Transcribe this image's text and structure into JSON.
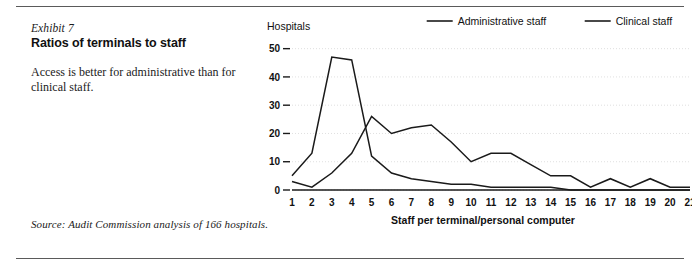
{
  "exhibit": {
    "label": "Exhibit 7",
    "title": "Ratios of terminals to staff",
    "description": "Access is better for administrative than for clinical staff.",
    "source": "Source: Audit Commission analysis of 166 hospitals."
  },
  "chart_data": {
    "type": "line",
    "title": "",
    "xlabel": "Staff per terminal/personal computer",
    "ylabel": "Hospitals",
    "x": [
      1,
      2,
      3,
      4,
      5,
      6,
      7,
      8,
      9,
      10,
      11,
      12,
      13,
      14,
      15,
      16,
      17,
      18,
      19,
      20,
      21
    ],
    "xticklabels": [
      "1",
      "2",
      "3",
      "4",
      "5",
      "6",
      "7",
      "8",
      "9",
      "10",
      "11",
      "12",
      "13",
      "14",
      "15",
      "16",
      "17",
      "18",
      "19",
      "20",
      "21"
    ],
    "yticklabels": [
      "0",
      "10",
      "20",
      "30",
      "40",
      "50"
    ],
    "yticks": [
      0,
      10,
      20,
      30,
      40,
      50
    ],
    "ylim": [
      0,
      52
    ],
    "xlim": [
      1,
      21
    ],
    "grid": "horizontal-dotted",
    "legend_position": "top-right",
    "series": [
      {
        "name": "Administrative staff",
        "values": [
          5,
          13,
          47,
          46,
          12,
          6,
          4,
          3,
          2,
          2,
          1,
          1,
          1,
          1,
          0,
          0,
          0,
          0,
          0,
          0,
          0
        ]
      },
      {
        "name": "Clinical staff",
        "values": [
          3,
          1,
          6,
          13,
          26,
          20,
          22,
          23,
          17,
          10,
          13,
          13,
          9,
          5,
          5,
          1,
          4,
          1,
          4,
          1,
          1
        ]
      }
    ]
  },
  "legend": {
    "items": [
      {
        "label": "Administrative staff"
      },
      {
        "label": "Clinical staff"
      }
    ]
  }
}
